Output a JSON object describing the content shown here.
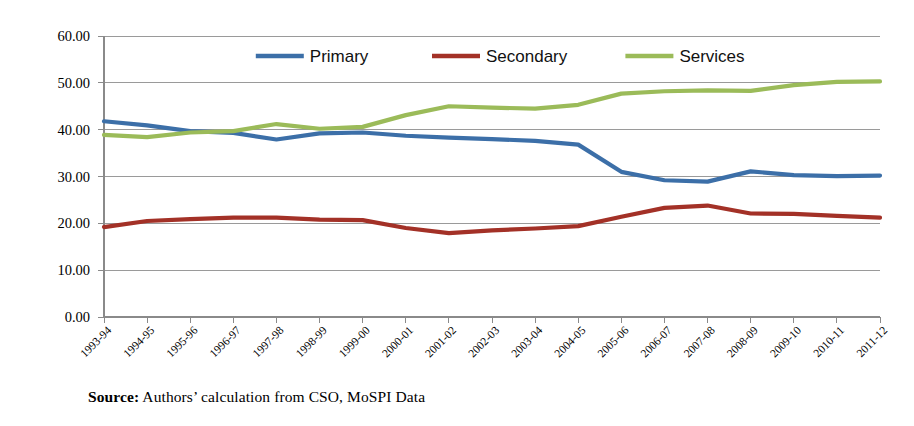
{
  "figure": {
    "source_prefix": "Source:",
    "source_text": " Authors’ calculation from CSO, MoSPI Data"
  },
  "colors": {
    "primary": "#3C6FA8",
    "secondary": "#A33127",
    "services": "#9BBB59",
    "gridline": "#9a9a9a",
    "axis": "#8a8a8a",
    "text": "#000000",
    "background": "#ffffff"
  },
  "legend": {
    "position": "top-center",
    "entries": [
      {
        "label": "Primary",
        "color": "#3C6FA8"
      },
      {
        "label": "Secondary",
        "color": "#A33127"
      },
      {
        "label": "Services",
        "color": "#9BBB59"
      }
    ]
  },
  "chart_data": {
    "type": "line",
    "title": "",
    "subtitle": "",
    "xlabel": "",
    "ylabel": "",
    "ylim": [
      0,
      60
    ],
    "ytick_step": 10,
    "grid": true,
    "legend_position": "top-center",
    "ytick_labels": [
      "0.00",
      "10.00",
      "20.00",
      "30.00",
      "40.00",
      "50.00",
      "60.00"
    ],
    "ytick_values": [
      0,
      10,
      20,
      30,
      40,
      50,
      60
    ],
    "categories": [
      "1993-94",
      "1994-95",
      "1995-96",
      "1996-97",
      "1997-98",
      "1998-99",
      "1999-00",
      "2000-01",
      "2001-02",
      "2002-03",
      "2003-04",
      "2004-05",
      "2005-06",
      "2006-07",
      "2007-08",
      "2008-09",
      "2009-10",
      "2010-11",
      "2011-12"
    ],
    "series": [
      {
        "name": "Primary",
        "color": "#3C6FA8",
        "values": [
          41.8,
          40.9,
          39.7,
          39.3,
          37.9,
          39.2,
          39.4,
          38.7,
          38.3,
          38.0,
          37.6,
          36.8,
          31.0,
          29.2,
          28.9,
          31.1,
          30.3,
          30.1,
          30.2
        ]
      },
      {
        "name": "Secondary",
        "color": "#A33127",
        "values": [
          19.2,
          20.5,
          20.9,
          21.2,
          21.2,
          20.8,
          20.7,
          19.0,
          17.9,
          18.5,
          18.9,
          19.4,
          21.4,
          23.3,
          23.8,
          22.1,
          22.0,
          21.6,
          21.2
        ]
      },
      {
        "name": "Services",
        "color": "#9BBB59",
        "values": [
          38.9,
          38.4,
          39.4,
          39.7,
          41.2,
          40.2,
          40.6,
          43.1,
          45.0,
          44.7,
          44.5,
          45.3,
          47.7,
          48.2,
          48.4,
          48.3,
          49.5,
          50.2,
          50.3
        ]
      }
    ]
  }
}
